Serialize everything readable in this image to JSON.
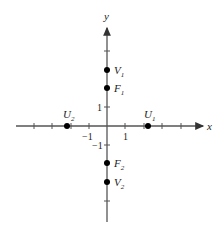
{
  "diagram": {
    "type": "coordinate-plane",
    "axes": {
      "x_label": "x",
      "y_label": "y"
    },
    "tick_labels": {
      "x_neg1": "−1",
      "x_pos1": "1",
      "y_pos1": "1",
      "y_neg1": "−1"
    },
    "points": [
      {
        "id": "V1",
        "name": "V",
        "sub": "1",
        "x": 0,
        "y": 3
      },
      {
        "id": "F1",
        "name": "F",
        "sub": "1",
        "x": 0,
        "y": 2
      },
      {
        "id": "F2",
        "name": "F",
        "sub": "2",
        "x": 0,
        "y": -2
      },
      {
        "id": "V2",
        "name": "V",
        "sub": "2",
        "x": 0,
        "y": -3
      },
      {
        "id": "U1",
        "name": "U",
        "sub": "1",
        "x": 2.2,
        "y": 0
      },
      {
        "id": "U2",
        "name": "U",
        "sub": "2",
        "x": -2.2,
        "y": 0
      }
    ],
    "colors": {
      "axis": "#555555",
      "point": "#000000",
      "text": "#222222"
    }
  }
}
